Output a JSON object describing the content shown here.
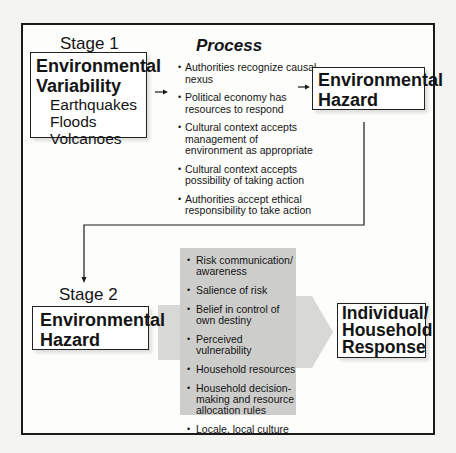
{
  "stage1": {
    "label": "Stage 1",
    "source_box": {
      "title_line1": "Environmental",
      "title_line2": "Variability",
      "items": [
        "Earthquakes",
        "Floods",
        "Volcanoes"
      ]
    },
    "process": {
      "title": "Process",
      "items": [
        "Authorities recognize causal nexus",
        "Political economy has resources to respond",
        "Cultural context accepts management of environment as appropriate",
        "Cultural context accepts possibility of taking action",
        "Authorities accept ethical responsibility to take action"
      ]
    },
    "result_box": {
      "title_line1": "Environmental",
      "title_line2": "Hazard"
    }
  },
  "stage2": {
    "label": "Stage 2",
    "source_box": {
      "title_line1": "Environmental",
      "title_line2": "Hazard"
    },
    "factors": [
      "Risk communication/ awareness",
      "Salience of risk",
      "Belief in control of own destiny",
      "Perceived vulnerability",
      "Household resources",
      "Household decision-making and resource allocation rules",
      "Locale, local culture"
    ],
    "result_box": {
      "title_line1": "Individual/",
      "title_line2": "Household",
      "title_line3": "Response"
    }
  },
  "colors": {
    "line": "#1a1a1a",
    "arrow_fill": "#d6d6d4",
    "panel_fill": "#cfcfcd"
  }
}
